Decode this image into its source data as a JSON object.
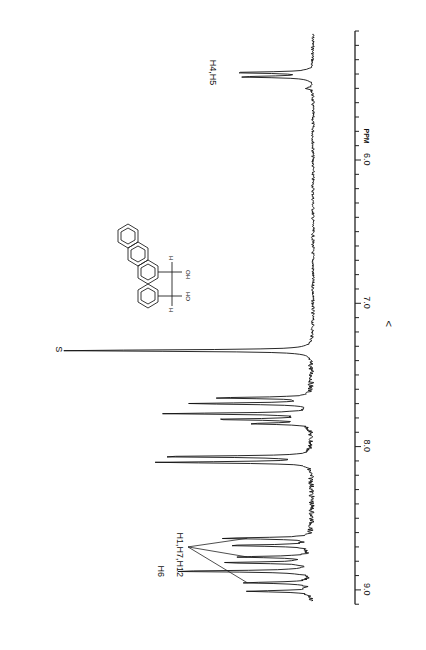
{
  "chart_data": {
    "type": "line",
    "title": "",
    "orientation": "rotated-90-clockwise",
    "xlabel": "PPM",
    "ylabel": "",
    "xaxis_direction_symbol": "<",
    "xlim": [
      5.1,
      9.1
    ],
    "xticks_major": [
      6.0,
      7.0,
      8.0,
      9.0
    ],
    "xtick_labels": [
      "6.0",
      "7.0",
      "8.0",
      "9.0"
    ],
    "minor_tick_step": 0.1,
    "grid": false,
    "baseline": 0,
    "peaks": [
      {
        "ppm": 5.39,
        "intensity": 0.31
      },
      {
        "ppm": 5.42,
        "intensity": 0.29
      },
      {
        "ppm": 5.5,
        "intensity": 0.03
      },
      {
        "ppm": 7.33,
        "intensity": 1.0
      },
      {
        "ppm": 7.66,
        "intensity": 0.38
      },
      {
        "ppm": 7.7,
        "intensity": 0.48
      },
      {
        "ppm": 7.77,
        "intensity": 0.57
      },
      {
        "ppm": 7.81,
        "intensity": 0.37
      },
      {
        "ppm": 7.84,
        "intensity": 0.23
      },
      {
        "ppm": 8.07,
        "intensity": 0.6
      },
      {
        "ppm": 8.11,
        "intensity": 0.61
      },
      {
        "ppm": 8.64,
        "intensity": 0.37
      },
      {
        "ppm": 8.69,
        "intensity": 0.33
      },
      {
        "ppm": 8.77,
        "intensity": 0.3
      },
      {
        "ppm": 8.81,
        "intensity": 0.34
      },
      {
        "ppm": 8.87,
        "intensity": 0.56
      },
      {
        "ppm": 8.95,
        "intensity": 0.27
      },
      {
        "ppm": 9.01,
        "intensity": 0.25
      }
    ],
    "annotations": [
      {
        "text": "H4,H5",
        "ppm": 5.4
      },
      {
        "text": "S",
        "ppm": 7.33
      },
      {
        "text": "H6",
        "ppm": 8.87
      },
      {
        "text": "H1,H7,H12",
        "ppm": 8.78,
        "pointer_ppms": [
          8.64,
          8.77,
          8.95
        ]
      }
    ],
    "inset": "structure-diagram: chrysene-like tetracyclic aromatic with CH(OH)-CH(OH) diol bridge; ring positions labelled 1, 4, 5, 7, 11/12"
  },
  "labels": {
    "ppm_unit": "PPM",
    "direction": "<",
    "h45": "H4,H5",
    "solvent": "S",
    "h6": "H6",
    "h1712": "H1,H7,H12",
    "ho": "HO",
    "oh": "OH",
    "h": "H"
  }
}
